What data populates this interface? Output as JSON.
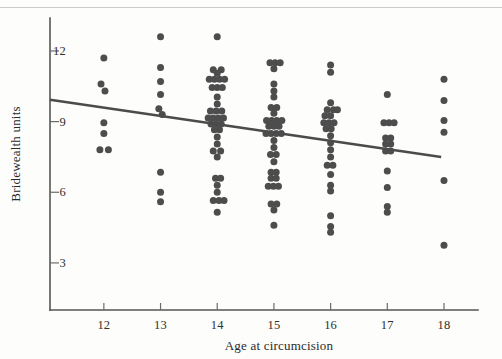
{
  "figure": {
    "background_color": "#fdfdfb",
    "point_color": "#4d4d4d",
    "line_color": "#4b4b4b",
    "axis_color": "#555555"
  },
  "chart_data": {
    "type": "scatter",
    "title": "",
    "xlabel": "Age at circumcision",
    "ylabel": "Bridewealth units",
    "xlim": [
      11.05,
      18.6
    ],
    "ylim": [
      1.0,
      13.4
    ],
    "xticks": [
      12,
      13,
      14,
      15,
      16,
      17,
      18
    ],
    "xticklabels": [
      "12",
      "13",
      "14",
      "15",
      "16",
      "17",
      "18"
    ],
    "yticks": [
      3,
      6,
      9,
      12
    ],
    "yticklabels": [
      "3",
      "6",
      "9",
      "12"
    ],
    "grid": false,
    "legend": null,
    "jitter": "horizontal",
    "regression_line": {
      "label": "fitted regression line",
      "x_start": 11.05,
      "y_start": 9.93,
      "x_end": 17.95,
      "y_end": 7.5,
      "slope": -0.352,
      "intercept": 13.82
    },
    "series": [
      {
        "name": "Bridewealth observations",
        "points": [
          {
            "x": 12.0,
            "y": 11.7
          },
          {
            "x": 11.95,
            "y": 10.6
          },
          {
            "x": 12.02,
            "y": 10.3
          },
          {
            "x": 12.0,
            "y": 8.95
          },
          {
            "x": 12.0,
            "y": 8.5
          },
          {
            "x": 11.93,
            "y": 7.8
          },
          {
            "x": 12.08,
            "y": 7.8
          },
          {
            "x": 13.0,
            "y": 12.6
          },
          {
            "x": 13.0,
            "y": 11.3
          },
          {
            "x": 13.0,
            "y": 10.7
          },
          {
            "x": 13.0,
            "y": 10.15
          },
          {
            "x": 12.97,
            "y": 9.55
          },
          {
            "x": 13.03,
            "y": 9.3
          },
          {
            "x": 13.0,
            "y": 6.85
          },
          {
            "x": 13.0,
            "y": 6.0
          },
          {
            "x": 13.0,
            "y": 5.6
          },
          {
            "x": 14.0,
            "y": 12.6
          },
          {
            "x": 13.93,
            "y": 11.2
          },
          {
            "x": 14.07,
            "y": 11.2
          },
          {
            "x": 14.0,
            "y": 11.05
          },
          {
            "x": 13.86,
            "y": 10.8
          },
          {
            "x": 13.95,
            "y": 10.8
          },
          {
            "x": 14.04,
            "y": 10.8
          },
          {
            "x": 14.13,
            "y": 10.8
          },
          {
            "x": 13.91,
            "y": 10.45
          },
          {
            "x": 14.0,
            "y": 10.45
          },
          {
            "x": 14.09,
            "y": 10.45
          },
          {
            "x": 14.0,
            "y": 10.05
          },
          {
            "x": 14.0,
            "y": 9.75
          },
          {
            "x": 13.88,
            "y": 9.45
          },
          {
            "x": 13.98,
            "y": 9.45
          },
          {
            "x": 14.08,
            "y": 9.45
          },
          {
            "x": 13.84,
            "y": 9.15
          },
          {
            "x": 13.93,
            "y": 9.15
          },
          {
            "x": 14.02,
            "y": 9.15
          },
          {
            "x": 14.11,
            "y": 9.15
          },
          {
            "x": 13.89,
            "y": 8.9
          },
          {
            "x": 13.98,
            "y": 8.9
          },
          {
            "x": 14.07,
            "y": 8.9
          },
          {
            "x": 13.95,
            "y": 8.65
          },
          {
            "x": 14.04,
            "y": 8.65
          },
          {
            "x": 14.0,
            "y": 8.35
          },
          {
            "x": 14.0,
            "y": 8.05
          },
          {
            "x": 13.93,
            "y": 7.75
          },
          {
            "x": 14.06,
            "y": 7.75
          },
          {
            "x": 14.0,
            "y": 7.5
          },
          {
            "x": 13.97,
            "y": 6.6
          },
          {
            "x": 14.06,
            "y": 6.6
          },
          {
            "x": 14.0,
            "y": 6.3
          },
          {
            "x": 14.0,
            "y": 6.0
          },
          {
            "x": 13.93,
            "y": 5.65
          },
          {
            "x": 14.03,
            "y": 5.65
          },
          {
            "x": 14.12,
            "y": 5.65
          },
          {
            "x": 14.0,
            "y": 5.15
          },
          {
            "x": 14.93,
            "y": 11.5
          },
          {
            "x": 15.02,
            "y": 11.5
          },
          {
            "x": 15.11,
            "y": 11.5
          },
          {
            "x": 15.0,
            "y": 11.25
          },
          {
            "x": 15.0,
            "y": 10.6
          },
          {
            "x": 15.0,
            "y": 10.3
          },
          {
            "x": 15.0,
            "y": 10.05
          },
          {
            "x": 14.95,
            "y": 9.6
          },
          {
            "x": 15.05,
            "y": 9.6
          },
          {
            "x": 15.0,
            "y": 9.35
          },
          {
            "x": 14.87,
            "y": 9.05
          },
          {
            "x": 14.96,
            "y": 9.05
          },
          {
            "x": 15.05,
            "y": 9.05
          },
          {
            "x": 15.14,
            "y": 9.05
          },
          {
            "x": 14.91,
            "y": 8.8
          },
          {
            "x": 15.0,
            "y": 8.8
          },
          {
            "x": 15.09,
            "y": 8.8
          },
          {
            "x": 14.86,
            "y": 8.5
          },
          {
            "x": 14.95,
            "y": 8.5
          },
          {
            "x": 15.04,
            "y": 8.5
          },
          {
            "x": 15.13,
            "y": 8.5
          },
          {
            "x": 15.0,
            "y": 8.2
          },
          {
            "x": 15.0,
            "y": 7.9
          },
          {
            "x": 14.94,
            "y": 7.6
          },
          {
            "x": 15.04,
            "y": 7.6
          },
          {
            "x": 15.0,
            "y": 7.3
          },
          {
            "x": 14.95,
            "y": 6.85
          },
          {
            "x": 15.04,
            "y": 6.85
          },
          {
            "x": 14.95,
            "y": 6.6
          },
          {
            "x": 15.04,
            "y": 6.6
          },
          {
            "x": 14.9,
            "y": 6.25
          },
          {
            "x": 14.99,
            "y": 6.25
          },
          {
            "x": 15.08,
            "y": 6.25
          },
          {
            "x": 14.95,
            "y": 5.5
          },
          {
            "x": 15.05,
            "y": 5.5
          },
          {
            "x": 15.0,
            "y": 5.25
          },
          {
            "x": 15.0,
            "y": 4.6
          },
          {
            "x": 16.0,
            "y": 11.4
          },
          {
            "x": 16.0,
            "y": 11.1
          },
          {
            "x": 16.0,
            "y": 9.8
          },
          {
            "x": 15.94,
            "y": 9.5
          },
          {
            "x": 16.05,
            "y": 9.5
          },
          {
            "x": 16.12,
            "y": 9.5
          },
          {
            "x": 15.9,
            "y": 9.25
          },
          {
            "x": 16.0,
            "y": 9.25
          },
          {
            "x": 15.88,
            "y": 8.95
          },
          {
            "x": 15.97,
            "y": 8.95
          },
          {
            "x": 16.06,
            "y": 8.95
          },
          {
            "x": 15.92,
            "y": 8.7
          },
          {
            "x": 16.01,
            "y": 8.7
          },
          {
            "x": 16.0,
            "y": 8.4
          },
          {
            "x": 16.0,
            "y": 8.1
          },
          {
            "x": 16.0,
            "y": 7.8
          },
          {
            "x": 16.0,
            "y": 7.5
          },
          {
            "x": 15.94,
            "y": 7.15
          },
          {
            "x": 16.04,
            "y": 7.15
          },
          {
            "x": 16.0,
            "y": 6.75
          },
          {
            "x": 16.0,
            "y": 6.3
          },
          {
            "x": 16.0,
            "y": 6.05
          },
          {
            "x": 16.0,
            "y": 5.0
          },
          {
            "x": 16.0,
            "y": 4.55
          },
          {
            "x": 16.0,
            "y": 4.3
          },
          {
            "x": 17.0,
            "y": 10.15
          },
          {
            "x": 16.94,
            "y": 8.95
          },
          {
            "x": 17.03,
            "y": 8.95
          },
          {
            "x": 17.12,
            "y": 8.95
          },
          {
            "x": 16.97,
            "y": 8.3
          },
          {
            "x": 17.06,
            "y": 8.3
          },
          {
            "x": 16.97,
            "y": 8.05
          },
          {
            "x": 17.06,
            "y": 8.05
          },
          {
            "x": 16.97,
            "y": 7.75
          },
          {
            "x": 17.06,
            "y": 7.75
          },
          {
            "x": 17.0,
            "y": 6.9
          },
          {
            "x": 17.0,
            "y": 6.2
          },
          {
            "x": 17.0,
            "y": 5.4
          },
          {
            "x": 17.0,
            "y": 5.15
          },
          {
            "x": 18.0,
            "y": 10.8
          },
          {
            "x": 18.0,
            "y": 9.9
          },
          {
            "x": 18.0,
            "y": 9.05
          },
          {
            "x": 18.0,
            "y": 8.55
          },
          {
            "x": 18.0,
            "y": 6.5
          },
          {
            "x": 18.0,
            "y": 3.75
          }
        ]
      }
    ]
  }
}
